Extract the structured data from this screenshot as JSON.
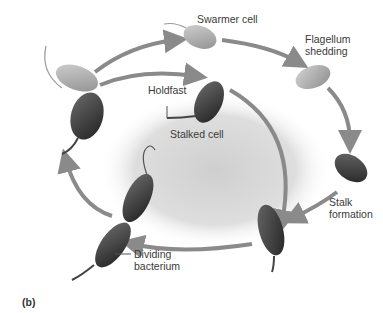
{
  "figure": {
    "panel_label": "(b)",
    "labels": {
      "swarmer_cell": "Swarmer cell",
      "flagellum_shedding_1": "Flagellum",
      "flagellum_shedding_2": "shedding",
      "holdfast": "Holdfast",
      "stalked_cell": "Stalked cell",
      "stalk_formation_1": "Stalk",
      "stalk_formation_2": "formation",
      "dividing_1": "Dividing",
      "dividing_2": "bacterium"
    },
    "colors": {
      "arrow": "#8a8a8a",
      "swarmer_cell": "#a9a9a9",
      "stalked_cell": "#3c3c3c",
      "center_shadow": "#d8d8d8",
      "text": "#3a3a3a"
    }
  }
}
